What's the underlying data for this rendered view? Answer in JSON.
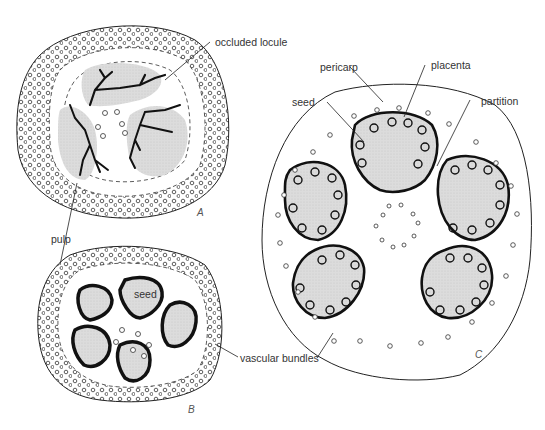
{
  "figure": {
    "panels": [
      {
        "id": "A",
        "letter": "A",
        "description": "cross section with occluded locule"
      },
      {
        "id": "B",
        "letter": "B",
        "description": "cross section with five seed cavities"
      },
      {
        "id": "C",
        "letter": "C",
        "description": "cross section with five placental locules"
      }
    ],
    "labels": {
      "occluded_locule": "occluded locule",
      "pulp": "pulp",
      "seed_b": "seed",
      "vascular_bundles": "vascular bundles",
      "pericarp": "pericarp",
      "placenta": "placenta",
      "seed_c": "seed",
      "partition": "partition"
    },
    "colors": {
      "line": "#111111",
      "fill_gray": "#d9d9d9",
      "background": "#ffffff"
    }
  }
}
